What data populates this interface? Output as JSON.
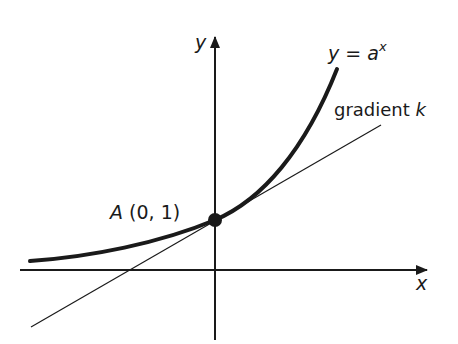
{
  "diagram": {
    "type": "exponential-curve-with-tangent",
    "colors": {
      "ink": "#1a1a1a",
      "background": "#ffffff"
    },
    "axes": {
      "x_label": "x",
      "y_label": "y"
    },
    "curve": {
      "label_lhs": "y",
      "label_eq": "=",
      "label_base": "a",
      "label_exp": "x"
    },
    "tangent": {
      "label_word": "gradient",
      "label_symbol": "k"
    },
    "point": {
      "name": "A",
      "coords": "(0, 1)"
    }
  }
}
